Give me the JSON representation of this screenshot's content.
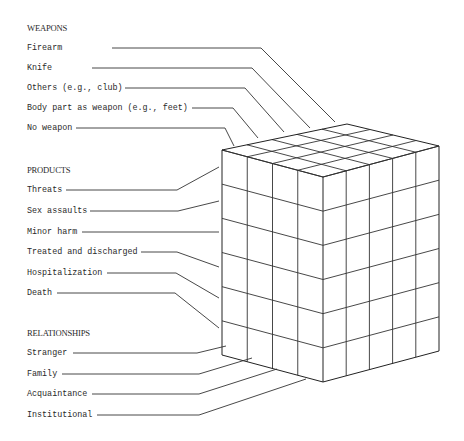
{
  "diagram": {
    "dimensions": [
      {
        "heading": "WEAPONS",
        "items": [
          "Firearm",
          "Knife",
          "Others (e.g., club)",
          "Body part as weapon (e.g., feet)",
          "No weapon"
        ]
      },
      {
        "heading": "PRODUCTS",
        "items": [
          "Threats",
          "Sex assaults",
          "Minor harm",
          "Treated and discharged",
          "Hospitalization",
          "Death"
        ]
      },
      {
        "heading": "RELATIONSHIPS",
        "items": [
          "Stranger",
          "Family",
          "Acquaintance",
          "Institutional"
        ]
      }
    ],
    "cube": {
      "left_face_columns": 4,
      "right_face_columns": 5,
      "rows": 6,
      "line_color": "#222222"
    }
  }
}
